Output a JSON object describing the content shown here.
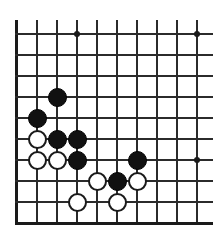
{
  "diagram": {
    "board_type": "go-board",
    "width_px": 223,
    "height_px": 240,
    "colors": {
      "background": "#ffffff",
      "grid_line": "#2b2b2b",
      "edge_line": "#1a1a1a",
      "black_stone": "#111111",
      "white_stone": "#ffffff",
      "white_stone_outline": "#1a1a1a",
      "star_point": "#1a1a1a"
    },
    "geometry": {
      "origin_x": 16,
      "origin_y": 33,
      "spacing_x": 20,
      "spacing_y": 21,
      "columns": 10,
      "rows": 10,
      "vertical_overhang_top": 13,
      "stone_diameter": 19
    },
    "grid": {
      "vertical_line_x": [
        16,
        36,
        56,
        76,
        96,
        116,
        136,
        156,
        176,
        196
      ],
      "horizontal_line_y": [
        33,
        54,
        75,
        96,
        117,
        138,
        159,
        180,
        201,
        222
      ],
      "bottom_edge_is_thick": true,
      "top_edge_is_thick": false
    },
    "star_points": [
      {
        "col": 3,
        "row": 0
      },
      {
        "col": 9,
        "row": 0
      },
      {
        "col": 9,
        "row": 6
      }
    ],
    "stones": [
      {
        "col": 2,
        "row": 3,
        "color": "black"
      },
      {
        "col": 1,
        "row": 4,
        "color": "black"
      },
      {
        "col": 1,
        "row": 5,
        "color": "white"
      },
      {
        "col": 2,
        "row": 5,
        "color": "black"
      },
      {
        "col": 3,
        "row": 5,
        "color": "black"
      },
      {
        "col": 1,
        "row": 6,
        "color": "white"
      },
      {
        "col": 2,
        "row": 6,
        "color": "white"
      },
      {
        "col": 3,
        "row": 6,
        "color": "black"
      },
      {
        "col": 6,
        "row": 6,
        "color": "black"
      },
      {
        "col": 4,
        "row": 7,
        "color": "white"
      },
      {
        "col": 5,
        "row": 7,
        "color": "black"
      },
      {
        "col": 6,
        "row": 7,
        "color": "white"
      },
      {
        "col": 3,
        "row": 8,
        "color": "white"
      },
      {
        "col": 5,
        "row": 8,
        "color": "white"
      }
    ],
    "counts": {
      "black_stones": "8",
      "white_stones": "6",
      "total_stones": "14"
    }
  }
}
